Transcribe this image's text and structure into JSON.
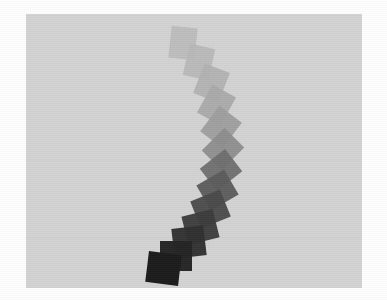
{
  "figure": {
    "width": 387,
    "height": 300,
    "page_background": "#ffffff",
    "title": "",
    "subtitle": "",
    "caption": ""
  },
  "plot": {
    "background": "#d4d4d4",
    "x": 26,
    "y": 14,
    "width": 336,
    "height": 274,
    "grid_visible": true,
    "grid_color": "#cccccc",
    "gridlines_y": [
      160,
      237
    ],
    "axis_labels_visible": false,
    "tick_labels_visible": false,
    "legend_visible": false
  },
  "chart_data": {
    "type": "scatter",
    "title": "",
    "xlabel": "",
    "ylabel": "",
    "xlim": [
      26,
      362
    ],
    "ylim": [
      14,
      288
    ],
    "grid": true,
    "legend": null,
    "marker": "rotated-rectangle",
    "colormap": "grays",
    "color_stops": [
      "#b9b9b9",
      "#1b1b1b"
    ],
    "series": [
      {
        "name": "link-chain",
        "values": [
          {
            "index": 0,
            "x": 183,
            "y": 43,
            "w": 26,
            "h": 32,
            "angle": 6,
            "color": "#bcbcbc",
            "opacity": 0.92
          },
          {
            "index": 1,
            "x": 199,
            "y": 62,
            "w": 26,
            "h": 32,
            "angle": 13,
            "color": "#b8b8b8",
            "opacity": 0.92
          },
          {
            "index": 2,
            "x": 211,
            "y": 83,
            "w": 27,
            "h": 32,
            "angle": 21,
            "color": "#b3b3b3",
            "opacity": 0.93
          },
          {
            "index": 3,
            "x": 216,
            "y": 105,
            "w": 27,
            "h": 32,
            "angle": 29,
            "color": "#aaaaaa",
            "opacity": 0.93
          },
          {
            "index": 4,
            "x": 221,
            "y": 127,
            "w": 28,
            "h": 32,
            "angle": 37,
            "color": "#9e9e9e",
            "opacity": 0.94
          },
          {
            "index": 5,
            "x": 223,
            "y": 149,
            "w": 28,
            "h": 32,
            "angle": 45,
            "color": "#8d8d8d",
            "opacity": 0.94
          },
          {
            "index": 6,
            "x": 221,
            "y": 170,
            "w": 28,
            "h": 32,
            "angle": 52,
            "color": "#6f6f6f",
            "opacity": 0.95
          },
          {
            "index": 7,
            "x": 217,
            "y": 190,
            "w": 29,
            "h": 32,
            "angle": 60,
            "color": "#5b5b5b",
            "opacity": 0.95
          },
          {
            "index": 8,
            "x": 210,
            "y": 209,
            "w": 29,
            "h": 32,
            "angle": 68,
            "color": "#4a4a4a",
            "opacity": 0.96
          },
          {
            "index": 9,
            "x": 200,
            "y": 227,
            "w": 29,
            "h": 32,
            "angle": 76,
            "color": "#3b3b3b",
            "opacity": 0.96
          },
          {
            "index": 10,
            "x": 189,
            "y": 242,
            "w": 30,
            "h": 32,
            "angle": 83,
            "color": "#2f2f2f",
            "opacity": 0.97
          },
          {
            "index": 11,
            "x": 176,
            "y": 256,
            "w": 30,
            "h": 32,
            "angle": 90,
            "color": "#242424",
            "opacity": 0.98
          },
          {
            "index": 12,
            "x": 163,
            "y": 268,
            "w": 31,
            "h": 33,
            "angle": 97,
            "color": "#1b1b1b",
            "opacity": 1.0
          }
        ]
      }
    ]
  }
}
